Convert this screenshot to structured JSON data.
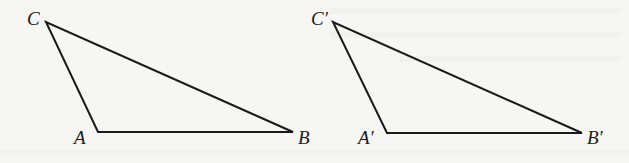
{
  "figure": {
    "line_color": "#1a1a1a",
    "background_color": "#f6f6f3"
  },
  "triangles": [
    {
      "name": "ABC",
      "vertices": {
        "A": {
          "label": "A",
          "x": 98,
          "y": 132
        },
        "B": {
          "label": "B",
          "x": 293,
          "y": 132
        },
        "C": {
          "label": "C",
          "x": 46,
          "y": 22
        }
      }
    },
    {
      "name": "A'B'C'",
      "vertices": {
        "A": {
          "label": "A′",
          "x": 387,
          "y": 133
        },
        "B": {
          "label": "B′",
          "x": 582,
          "y": 133
        },
        "C": {
          "label": "C′",
          "x": 333,
          "y": 22
        }
      }
    }
  ]
}
